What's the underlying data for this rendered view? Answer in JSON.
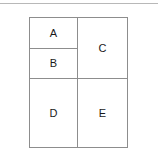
{
  "figure": {
    "type": "partition-diagram",
    "top_rule_color": "#b8b8b8",
    "border_color": "#8d8d8d",
    "background_color": "#ffffff",
    "label_color": "#1a1a1a",
    "regions": [
      {
        "id": "a",
        "label": "A",
        "column": "left",
        "row": "top",
        "order": 1
      },
      {
        "id": "b",
        "label": "B",
        "column": "left",
        "row": "top",
        "order": 2
      },
      {
        "id": "c",
        "label": "C",
        "column": "right",
        "row": "top",
        "order": 1
      },
      {
        "id": "d",
        "label": "D",
        "column": "left",
        "row": "bottom",
        "order": 1
      },
      {
        "id": "e",
        "label": "E",
        "column": "right",
        "row": "bottom",
        "order": 1
      }
    ]
  }
}
